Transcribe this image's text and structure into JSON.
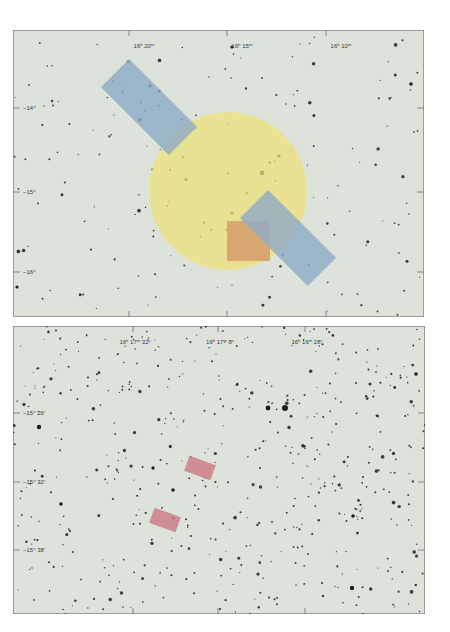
{
  "colors": {
    "page_bg": "#ffffff",
    "plate_bg": "#dde3da",
    "frame": "#6e6e6e",
    "star": "#1e1e1e",
    "circle": "#ece27a",
    "blue_rect": "#8eaac6",
    "orange_rect": "#d59a6a",
    "red_rect": "#c9727f"
  },
  "panels": [
    {
      "id": "panel-1",
      "x": 13,
      "y": 30,
      "w": 411,
      "h": 287,
      "ra_labels": [
        {
          "text": "16ʰ 20ᵐ",
          "x": 131,
          "tick_x": 116
        },
        {
          "text": "16ʰ 15ᵐ",
          "x": 229,
          "tick_x": 214
        },
        {
          "text": "16ʰ 10ᵐ",
          "x": 328,
          "tick_x": 313
        }
      ],
      "dec_labels": [
        {
          "text": "−14°",
          "y": 78
        },
        {
          "text": "−15°",
          "y": 162
        },
        {
          "text": "−16°",
          "y": 242
        }
      ],
      "overlays": {
        "circle": {
          "cx": 215,
          "cy": 161,
          "r": 79,
          "opacity": 0.75
        },
        "blue_rects": [
          {
            "cx": 136,
            "cy": 77,
            "w": 96,
            "h": 40,
            "angle": 45,
            "opacity": 0.8
          },
          {
            "cx": 275,
            "cy": 208,
            "w": 96,
            "h": 40,
            "angle": 45,
            "opacity": 0.8
          }
        ],
        "orange_rect": {
          "x": 214,
          "y": 191,
          "w": 43,
          "h": 40,
          "opacity": 0.8
        }
      }
    },
    {
      "id": "panel-2",
      "x": 13,
      "y": 326,
      "w": 412,
      "h": 288,
      "ra_labels": [
        {
          "text": "16ʰ 17ᵐ 32ˢ",
          "x": 122,
          "tick_x": 120
        },
        {
          "text": "16ʰ 17ᵐ 8ˢ",
          "x": 207,
          "tick_x": 205
        },
        {
          "text": "16ʰ 16ᵐ 28ˢ",
          "x": 294,
          "tick_x": 292
        }
      ],
      "dec_labels": [
        {
          "text": "−15° 26′",
          "y": 87
        },
        {
          "text": "−15° 32′",
          "y": 156
        },
        {
          "text": "−15° 38′",
          "y": 224
        }
      ],
      "overlays": {
        "red_rects": [
          {
            "cx": 187,
            "cy": 142,
            "w": 28,
            "h": 16,
            "angle": 20,
            "opacity": 0.75
          },
          {
            "cx": 152,
            "cy": 194,
            "w": 28,
            "h": 16,
            "angle": 20,
            "opacity": 0.75
          }
        ]
      }
    }
  ]
}
